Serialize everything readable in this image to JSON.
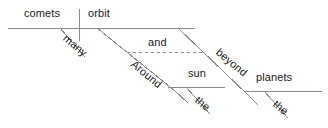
{
  "diagram": {
    "type": "reed-kellogg-sentence-diagram",
    "sentence": "Around and beyond the sun many comets orbit the planets",
    "canvas": {
      "width": 328,
      "height": 128,
      "background": "#ffffff"
    },
    "style": {
      "line_color": "#8c8c8c",
      "text_color": "#1a1a1a",
      "font_size_px": 11
    },
    "words": {
      "subject": "comets",
      "verb": "orbit",
      "subject_modifier": "many",
      "object": "planets",
      "object_modifier": "the",
      "preposition_1": "Around",
      "conjunction": "and",
      "preposition_2": "beyond",
      "prep_object": "sun",
      "prep_object_modifier": "the"
    },
    "labels": [
      {
        "id": "subject",
        "text": "comets",
        "x": 24,
        "y": 8,
        "rotation": 0
      },
      {
        "id": "verb",
        "text": "orbit",
        "x": 88,
        "y": 8,
        "rotation": 0
      },
      {
        "id": "subject-modifier",
        "text": "many",
        "x": 61,
        "y": 30,
        "rotation": 40
      },
      {
        "id": "conjunction",
        "text": "and",
        "x": 148,
        "y": 37,
        "rotation": 0
      },
      {
        "id": "preposition-1",
        "text": "Around",
        "x": 129,
        "y": 56,
        "rotation": 40
      },
      {
        "id": "preposition-2",
        "text": "beyond",
        "x": 214,
        "y": 44,
        "rotation": 40
      },
      {
        "id": "prep-object",
        "text": "sun",
        "x": 188,
        "y": 68,
        "rotation": 0
      },
      {
        "id": "prep-object-modifier",
        "text": "the",
        "x": 193,
        "y": 92,
        "rotation": 40
      },
      {
        "id": "object",
        "text": "planets",
        "x": 256,
        "y": 72,
        "rotation": 0
      },
      {
        "id": "object-modifier",
        "text": "the",
        "x": 271,
        "y": 96,
        "rotation": 40
      }
    ],
    "lines": [
      {
        "id": "main-baseline",
        "kind": "solid",
        "x1": 8,
        "y1": 28,
        "x2": 195,
        "y2": 28
      },
      {
        "id": "subject-verb-divider",
        "kind": "solid",
        "x1": 79,
        "y1": 9,
        "x2": 79,
        "y2": 41
      },
      {
        "id": "many-slant",
        "kind": "solid",
        "x1": 60,
        "y1": 28,
        "x2": 85,
        "y2": 57
      },
      {
        "id": "around-slant",
        "kind": "solid",
        "x1": 97,
        "y1": 28,
        "x2": 175,
        "y2": 91
      },
      {
        "id": "around-slant-tail",
        "kind": "solid",
        "x1": 175,
        "y1": 91,
        "x2": 188,
        "y2": 103
      },
      {
        "id": "conjunction-dashed",
        "kind": "dashed",
        "x1": 127,
        "y1": 52,
        "x2": 205,
        "y2": 52
      },
      {
        "id": "beyond-slant",
        "kind": "solid",
        "x1": 178,
        "y1": 28,
        "x2": 248,
        "y2": 95
      },
      {
        "id": "beyond-slant-tail",
        "kind": "solid",
        "x1": 248,
        "y1": 95,
        "x2": 258,
        "y2": 105
      },
      {
        "id": "sun-baseline",
        "kind": "solid",
        "x1": 168,
        "y1": 87,
        "x2": 225,
        "y2": 87
      },
      {
        "id": "sun-the-slant",
        "kind": "solid",
        "x1": 186,
        "y1": 87,
        "x2": 210,
        "y2": 114
      },
      {
        "id": "planets-baseline",
        "kind": "solid",
        "x1": 245,
        "y1": 91,
        "x2": 322,
        "y2": 91
      },
      {
        "id": "planets-the-slant",
        "kind": "solid",
        "x1": 264,
        "y1": 91,
        "x2": 288,
        "y2": 118
      }
    ]
  }
}
